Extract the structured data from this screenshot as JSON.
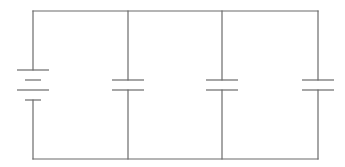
{
  "diagram": {
    "type": "circuit-schematic",
    "stroke_color": "#6b6b6b",
    "background_color": "#ffffff",
    "frame": {
      "left_x": 33,
      "right_x": 318,
      "top_y": 11,
      "bottom_y": 159
    },
    "components": [
      {
        "kind": "battery",
        "label": "",
        "x": 33,
        "cells": 2,
        "plates": [
          {
            "y": 70,
            "half_width": 16,
            "polarity": "positive"
          },
          {
            "y": 80,
            "half_width": 8,
            "polarity": "negative"
          },
          {
            "y": 90,
            "half_width": 16,
            "polarity": "positive"
          },
          {
            "y": 100,
            "half_width": 8,
            "polarity": "negative"
          }
        ]
      },
      {
        "kind": "capacitor",
        "label": "",
        "x": 128,
        "plate_top_y": 80,
        "plate_bottom_y": 90,
        "half_width": 16
      },
      {
        "kind": "capacitor",
        "label": "",
        "x": 222,
        "plate_top_y": 80,
        "plate_bottom_y": 90,
        "half_width": 16
      },
      {
        "kind": "capacitor",
        "label": "",
        "x": 318,
        "plate_top_y": 80,
        "plate_bottom_y": 90,
        "half_width": 16
      }
    ]
  }
}
